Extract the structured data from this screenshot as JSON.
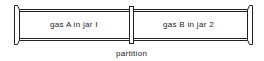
{
  "diagram": {
    "jar1_label": "gas A in jar I",
    "jar2_label": "gas B in jar 2",
    "partition_label": "partition",
    "stroke_color": "#222222"
  }
}
